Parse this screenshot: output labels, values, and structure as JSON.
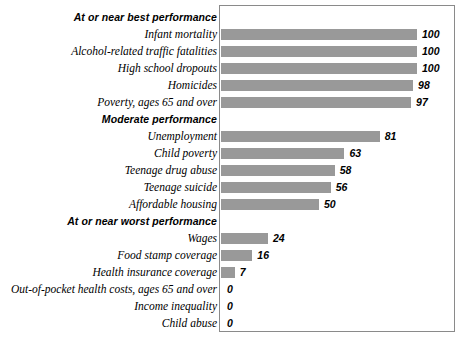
{
  "chart_data": {
    "type": "bar",
    "title": "",
    "xlabel": "",
    "ylabel": "",
    "xlim": [
      0,
      100
    ],
    "grid": false,
    "legend": null,
    "orientation": "horizontal",
    "sections": [
      {
        "header": "At or near best performance",
        "items": [
          {
            "label": "Infant mortality",
            "value": 100
          },
          {
            "label": "Alcohol-related traffic fatalities",
            "value": 100
          },
          {
            "label": "High school dropouts",
            "value": 100
          },
          {
            "label": "Homicides",
            "value": 98
          },
          {
            "label": "Poverty, ages 65 and over",
            "value": 97
          }
        ]
      },
      {
        "header": "Moderate performance",
        "items": [
          {
            "label": "Unemployment",
            "value": 81
          },
          {
            "label": "Child poverty",
            "value": 63
          },
          {
            "label": "Teenage drug abuse",
            "value": 58
          },
          {
            "label": "Teenage suicide",
            "value": 56
          },
          {
            "label": "Affordable housing",
            "value": 50
          }
        ]
      },
      {
        "header": "At or near worst performance",
        "items": [
          {
            "label": "Wages",
            "value": 24
          },
          {
            "label": "Food stamp coverage",
            "value": 16
          },
          {
            "label": "Health insurance coverage",
            "value": 7
          },
          {
            "label": "Out-of-pocket health costs, ages 65 and over",
            "value": 0
          },
          {
            "label": "Income inequality",
            "value": 0
          },
          {
            "label": "Child abuse",
            "value": 0
          }
        ]
      }
    ],
    "categories": [
      "Infant mortality",
      "Alcohol-related traffic fatalities",
      "High school dropouts",
      "Homicides",
      "Poverty, ages 65 and over",
      "Unemployment",
      "Child poverty",
      "Teenage drug abuse",
      "Teenage suicide",
      "Affordable housing",
      "Wages",
      "Food stamp coverage",
      "Health insurance coverage",
      "Out-of-pocket health costs, ages 65 and over",
      "Income inequality",
      "Child abuse"
    ],
    "values": [
      100,
      100,
      100,
      98,
      97,
      81,
      63,
      58,
      56,
      50,
      24,
      16,
      7,
      0,
      0,
      0
    ],
    "colors": {
      "bar": "#999999",
      "frame": "#8a8a8a",
      "background": "#ffffff",
      "text": "#000000"
    }
  }
}
